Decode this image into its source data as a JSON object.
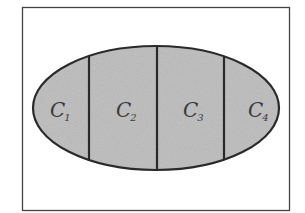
{
  "diagram": {
    "frame": {
      "x": 22,
      "y": 7,
      "width": 267,
      "height": 203,
      "stroke": "#444444"
    },
    "ellipse": {
      "cx": 156,
      "cy": 108,
      "rx": 123,
      "ry": 62,
      "fill": "#c4c4c4",
      "stroke": "#2a2a2a"
    },
    "dividers_x": [
      89,
      157,
      224
    ],
    "regions": [
      {
        "id": "c1",
        "label": "C",
        "subscript": "1",
        "x": 50,
        "y": 117
      },
      {
        "id": "c2",
        "label": "C",
        "subscript": "2",
        "x": 116,
        "y": 117
      },
      {
        "id": "c3",
        "label": "C",
        "subscript": "3",
        "x": 183,
        "y": 117
      },
      {
        "id": "c4",
        "label": "C",
        "subscript": "4",
        "x": 248,
        "y": 117
      }
    ]
  }
}
